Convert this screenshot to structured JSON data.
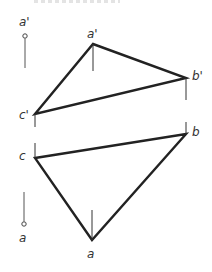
{
  "diagram": {
    "type": "orthographic-projection",
    "colors": {
      "stroke": "#222222",
      "text": "#333333",
      "background": "#ffffff"
    },
    "front_view": {
      "vertices": [
        {
          "id": "a_prime",
          "label": "a'",
          "x": 93,
          "y": 44
        },
        {
          "id": "b_prime",
          "label": "b'",
          "x": 186,
          "y": 78
        },
        {
          "id": "c_prime",
          "label": "c'",
          "x": 35,
          "y": 114
        }
      ]
    },
    "top_view": {
      "vertices": [
        {
          "id": "a",
          "label": "a",
          "x": 92,
          "y": 240
        },
        {
          "id": "b",
          "label": "b",
          "x": 186,
          "y": 134
        },
        {
          "id": "c",
          "label": "c",
          "x": 35,
          "y": 158
        }
      ]
    },
    "reference_markers": [
      {
        "id": "ref_a_prime",
        "label": "a'"
      },
      {
        "id": "ref_a",
        "label": "a"
      }
    ]
  }
}
